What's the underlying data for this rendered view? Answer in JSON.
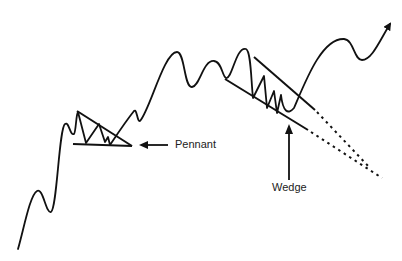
{
  "diagram": {
    "type": "chart-pattern-illustration",
    "colors": {
      "line": "#111111",
      "background": "#ffffff",
      "text": "#222222"
    },
    "labels": {
      "pennant": "Pennant",
      "wedge": "Wedge"
    },
    "elements": [
      {
        "name": "price-line",
        "description": "Rising zig-zag price path ending with an up arrow"
      },
      {
        "name": "pennant",
        "description": "Converging triangle: descending upper trendline, flat lower trendline"
      },
      {
        "name": "wedge",
        "description": "Falling wedge: two downward-sloping converging trendlines with dotted extensions"
      }
    ]
  }
}
